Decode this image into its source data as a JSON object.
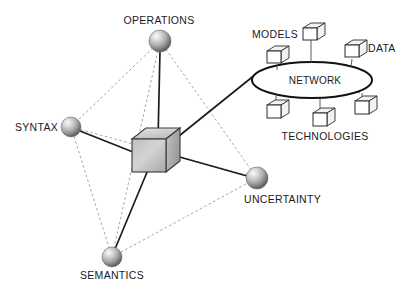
{
  "diagram": {
    "background_color": "#ffffff",
    "width": 406,
    "height": 297,
    "colors": {
      "solid_edge": "#1c1c1c",
      "dashed_edge": "#9a9a9a",
      "spoke": "#7d7d7d",
      "sphere_light": "#f0f0f0",
      "sphere_mid": "#b8b8b8",
      "sphere_dark": "#6e6e6e",
      "cube_face": "#c9c9c9",
      "text": "#1a1a1a",
      "ellipse_stroke": "#111111",
      "box_fill": "#ffffff"
    }
  },
  "nodes": {
    "center": {
      "id": "core-cube",
      "shape": "cube",
      "label": "",
      "x": 152,
      "y": 150
    },
    "spheres": [
      {
        "id": "operations",
        "label": "OPERATIONS",
        "x": 160,
        "y": 41,
        "r": 11,
        "label_x": 159,
        "label_y": 24,
        "label_anchor": "middle"
      },
      {
        "id": "syntax",
        "label": "SYNTAX",
        "x": 71,
        "y": 127,
        "r": 10,
        "label_x": 58,
        "label_y": 131,
        "label_anchor": "end"
      },
      {
        "id": "semantics",
        "label": "SEMANTICS",
        "x": 112,
        "y": 257,
        "r": 10,
        "label_x": 112,
        "label_y": 279,
        "label_anchor": "middle"
      },
      {
        "id": "uncertainty",
        "label": "UNCERTAINTY",
        "x": 257,
        "y": 178,
        "r": 11,
        "label_x": 244,
        "label_y": 203,
        "label_anchor": "start"
      }
    ]
  },
  "network": {
    "label": "NETWORK",
    "ellipse": {
      "cx": 312,
      "cy": 80,
      "rx": 60,
      "ry": 18
    },
    "label_x": 315,
    "label_y": 84,
    "group_labels": [
      {
        "id": "models",
        "text": "MODELS",
        "x": 252,
        "y": 38,
        "anchor": "start"
      },
      {
        "id": "data",
        "text": "DATA",
        "x": 368,
        "y": 52,
        "anchor": "start"
      },
      {
        "id": "technologies",
        "text": "TECHNOLOGIES",
        "x": 325,
        "y": 140,
        "anchor": "middle"
      }
    ],
    "terminals": [
      {
        "id": "terminal-models-upper",
        "bx": 305,
        "by": 30,
        "anchor_x": 311,
        "anchor_y": 63
      },
      {
        "id": "terminal-models-left",
        "bx": 273,
        "by": 55,
        "anchor_x": 277,
        "anchor_y": 69
      },
      {
        "id": "terminal-data",
        "bx": 353,
        "by": 49,
        "anchor_x": 349,
        "anchor_y": 66
      },
      {
        "id": "terminal-tech-left",
        "bx": 273,
        "by": 111,
        "anchor_x": 278,
        "anchor_y": 93
      },
      {
        "id": "terminal-tech-center",
        "bx": 322,
        "by": 119,
        "anchor_x": 320,
        "anchor_y": 97
      },
      {
        "id": "terminal-tech-right",
        "bx": 368,
        "by": 106,
        "anchor_x": 362,
        "anchor_y": 93
      }
    ]
  },
  "edges": {
    "solid": [
      {
        "id": "edge-core-operations",
        "from": "core-cube",
        "to": "operations"
      },
      {
        "id": "edge-core-syntax",
        "from": "core-cube",
        "to": "syntax"
      },
      {
        "id": "edge-core-semantics",
        "from": "core-cube",
        "to": "semantics"
      },
      {
        "id": "edge-core-uncertainty",
        "from": "core-cube",
        "to": "uncertainty"
      },
      {
        "id": "edge-core-network",
        "from": "core-cube",
        "to": "network"
      }
    ],
    "dashed": [
      {
        "id": "edge-operations-syntax",
        "from": "operations",
        "to": "syntax"
      },
      {
        "id": "edge-operations-semantics",
        "from": "operations",
        "to": "semantics"
      },
      {
        "id": "edge-operations-uncertainty",
        "from": "operations",
        "to": "uncertainty"
      },
      {
        "id": "edge-syntax-semantics",
        "from": "syntax",
        "to": "semantics"
      },
      {
        "id": "edge-syntax-uncertainty",
        "from": "syntax",
        "to": "uncertainty"
      },
      {
        "id": "edge-semantics-uncertainty",
        "from": "semantics",
        "to": "uncertainty"
      }
    ]
  }
}
